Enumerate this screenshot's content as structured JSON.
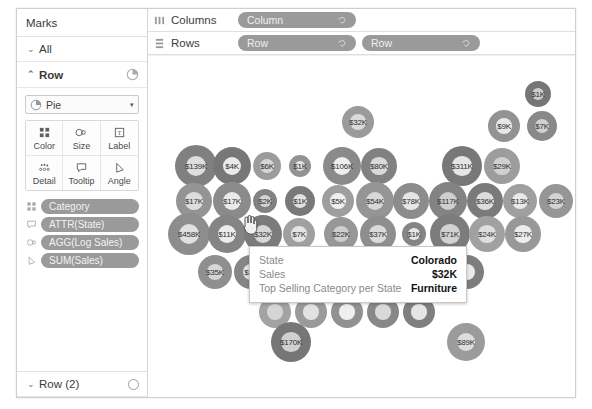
{
  "marks_panel": {
    "title": "Marks",
    "all_shelf": {
      "label": "All",
      "caret": "⌄"
    },
    "row_shelf": {
      "label": "Row",
      "caret": "⌃",
      "icon": "pie-chart-icon"
    },
    "mark_type": {
      "label": "Pie",
      "icon": "pie-chart-icon",
      "arrow": "▾"
    },
    "properties": [
      {
        "name": "Color",
        "icon": "color-squares-icon"
      },
      {
        "name": "Size",
        "icon": "size-circles-icon"
      },
      {
        "name": "Label",
        "icon": "label-text-icon"
      },
      {
        "name": "Detail",
        "icon": "detail-dots-icon"
      },
      {
        "name": "Tooltip",
        "icon": "tooltip-bubble-icon"
      },
      {
        "name": "Angle",
        "icon": "angle-icon"
      }
    ],
    "fields": [
      {
        "label": "Category",
        "icon": "color-squares-icon"
      },
      {
        "label": "ATTR(State)",
        "icon": "tooltip-bubble-icon"
      },
      {
        "label": "AGG(Log Sales)",
        "icon": "size-circles-icon"
      },
      {
        "label": "SUM(Sales)",
        "icon": "angle-icon"
      }
    ],
    "bottom_shelf": {
      "label": "Row (2)",
      "caret": "⌄",
      "icon": "empty-circle-icon"
    }
  },
  "shelves": {
    "columns": {
      "label": "Columns",
      "icon": "columns-icon",
      "pills": [
        "Column"
      ]
    },
    "rows": {
      "label": "Rows",
      "icon": "rows-icon",
      "pills": [
        "Row",
        "Row"
      ]
    }
  },
  "tooltip": {
    "rows": [
      {
        "key": "State",
        "value": "Colorado"
      },
      {
        "key": "Sales",
        "value": "$32K"
      },
      {
        "key": "Top Selling Category per State",
        "value": "Furniture"
      }
    ]
  },
  "chart_data": {
    "type": "scatter",
    "title": "",
    "xlabel": "Column",
    "ylabel": "Row",
    "grid": false,
    "legend": "none",
    "mark": "pie",
    "value_field": "Sales",
    "size_field": "AGG(Log Sales)",
    "label_prefix": "$",
    "label_suffix": "K",
    "points": [
      {
        "label": "$1K",
        "value": 1,
        "x": 538,
        "y": 100,
        "r": 13
      },
      {
        "label": "$32K",
        "value": 32,
        "x": 358,
        "y": 128,
        "r": 16
      },
      {
        "label": "$9K",
        "value": 9,
        "x": 504,
        "y": 132,
        "r": 16
      },
      {
        "label": "$7K",
        "value": 7,
        "x": 542,
        "y": 132,
        "r": 15
      },
      {
        "label": "$139K",
        "value": 139,
        "x": 196,
        "y": 172,
        "r": 21
      },
      {
        "label": "$4K",
        "value": 4,
        "x": 232,
        "y": 172,
        "r": 19
      },
      {
        "label": "$6K",
        "value": 6,
        "x": 267,
        "y": 172,
        "r": 14
      },
      {
        "label": "$1K",
        "value": 1,
        "x": 300,
        "y": 172,
        "r": 11
      },
      {
        "label": "$106K",
        "value": 106,
        "x": 342,
        "y": 172,
        "r": 19
      },
      {
        "label": "$80K",
        "value": 80,
        "x": 379,
        "y": 172,
        "r": 18
      },
      {
        "label": "$311K",
        "value": 311,
        "x": 462,
        "y": 172,
        "r": 20
      },
      {
        "label": "$29K",
        "value": 29,
        "x": 502,
        "y": 172,
        "r": 18
      },
      {
        "label": "$17K",
        "value": 17,
        "x": 194,
        "y": 207,
        "r": 18
      },
      {
        "label": "$17K",
        "value": 17,
        "x": 232,
        "y": 207,
        "r": 19
      },
      {
        "label": "$2K",
        "value": 2,
        "x": 265,
        "y": 207,
        "r": 12
      },
      {
        "label": "$1K",
        "value": 1,
        "x": 300,
        "y": 207,
        "r": 15
      },
      {
        "label": "$5K",
        "value": 5,
        "x": 338,
        "y": 207,
        "r": 16
      },
      {
        "label": "$54K",
        "value": 54,
        "x": 375,
        "y": 207,
        "r": 19
      },
      {
        "label": "$78K",
        "value": 78,
        "x": 411,
        "y": 207,
        "r": 18
      },
      {
        "label": "$117K",
        "value": 117,
        "x": 448,
        "y": 207,
        "r": 19
      },
      {
        "label": "$36K",
        "value": 36,
        "x": 485,
        "y": 207,
        "r": 18
      },
      {
        "label": "$13K",
        "value": 13,
        "x": 520,
        "y": 207,
        "r": 17
      },
      {
        "label": "$23K",
        "value": 23,
        "x": 556,
        "y": 207,
        "r": 17
      },
      {
        "label": "$458K",
        "value": 458,
        "x": 189,
        "y": 240,
        "r": 21
      },
      {
        "label": "$11K",
        "value": 11,
        "x": 227,
        "y": 240,
        "r": 19
      },
      {
        "label": "$32K",
        "value": 32,
        "x": 263,
        "y": 240,
        "r": 19
      },
      {
        "label": "$7K",
        "value": 7,
        "x": 299,
        "y": 240,
        "r": 16
      },
      {
        "label": "$22K",
        "value": 22,
        "x": 341,
        "y": 240,
        "r": 17
      },
      {
        "label": "$37K",
        "value": 37,
        "x": 378,
        "y": 240,
        "r": 18
      },
      {
        "label": "$1K",
        "value": 1,
        "x": 414,
        "y": 240,
        "r": 12
      },
      {
        "label": "$71K",
        "value": 71,
        "x": 450,
        "y": 240,
        "r": 20
      },
      {
        "label": "$24K",
        "value": 24,
        "x": 487,
        "y": 240,
        "r": 18
      },
      {
        "label": "$27K",
        "value": 27,
        "x": 523,
        "y": 240,
        "r": 18
      },
      {
        "label": "$35K",
        "value": 35,
        "x": 215,
        "y": 278,
        "r": 17
      },
      {
        "label": "$5K",
        "value": 5,
        "x": 251,
        "y": 278,
        "r": 17
      },
      {
        "label": "",
        "value": null,
        "x": 287,
        "y": 278,
        "r": 17
      },
      {
        "label": "",
        "value": null,
        "x": 323,
        "y": 278,
        "r": 17
      },
      {
        "label": "",
        "value": null,
        "x": 359,
        "y": 278,
        "r": 17
      },
      {
        "label": "",
        "value": null,
        "x": 395,
        "y": 278,
        "r": 17
      },
      {
        "label": "",
        "value": null,
        "x": 431,
        "y": 278,
        "r": 17
      },
      {
        "label": "",
        "value": null,
        "x": 467,
        "y": 278,
        "r": 17
      },
      {
        "label": "",
        "value": null,
        "x": 275,
        "y": 318,
        "r": 16
      },
      {
        "label": "",
        "value": null,
        "x": 311,
        "y": 318,
        "r": 16
      },
      {
        "label": "",
        "value": null,
        "x": 347,
        "y": 318,
        "r": 16
      },
      {
        "label": "",
        "value": null,
        "x": 383,
        "y": 318,
        "r": 16
      },
      {
        "label": "",
        "value": null,
        "x": 419,
        "y": 318,
        "r": 16
      },
      {
        "label": "$170K",
        "value": 170,
        "x": 291,
        "y": 348,
        "r": 20
      },
      {
        "label": "$89K",
        "value": 89,
        "x": 466,
        "y": 348,
        "r": 19
      }
    ]
  }
}
